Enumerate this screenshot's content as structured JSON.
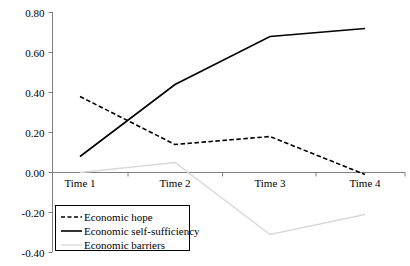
{
  "chart_data": {
    "type": "line",
    "title": "",
    "subtitle": "",
    "xlabel": "",
    "ylabel": "",
    "categories": [
      "Time 1",
      "Time 2",
      "Time 3",
      "Time 4"
    ],
    "yticks": [
      "0.80",
      "0.60",
      "0.40",
      "0.20",
      "0.00",
      "-0.20",
      "-0.40"
    ],
    "ytick_values": [
      0.8,
      0.6,
      0.4,
      0.2,
      0.0,
      -0.2,
      -0.4
    ],
    "ylim": [
      -0.4,
      0.8
    ],
    "grid": false,
    "legend_position": "bottom-left",
    "series": [
      {
        "name": "Economic hope",
        "style": "dashed",
        "color": "#000000",
        "values": [
          0.38,
          0.14,
          0.18,
          -0.01
        ]
      },
      {
        "name": "Economic self-sufficiency",
        "style": "solid",
        "color": "#000000",
        "values": [
          0.08,
          0.44,
          0.68,
          0.72
        ]
      },
      {
        "name": "Economic barriers",
        "style": "solid-light",
        "color": "#d9d9d9",
        "values": [
          0.0,
          0.05,
          -0.31,
          -0.21
        ]
      }
    ]
  },
  "axis": {
    "zero_line_label": "0.00",
    "y_top_label": "0.80",
    "y_bottom_label": "-0.40"
  },
  "legend": {
    "items": [
      {
        "label": "Economic hope",
        "style": "dashed",
        "color": "#000000"
      },
      {
        "label": "Economic self-sufficiency",
        "style": "solid",
        "color": "#000000"
      },
      {
        "label": "Economic barriers",
        "style": "solid-light",
        "color": "#d9d9d9"
      }
    ]
  },
  "colors": {
    "axis": "#808080",
    "series_dark": "#000000",
    "series_light": "#d9d9d9",
    "legend_border": "#000000",
    "background": "#ffffff"
  }
}
